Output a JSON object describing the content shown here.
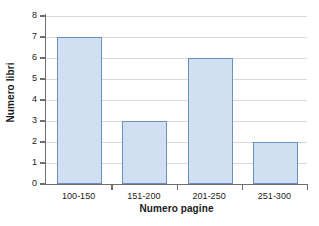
{
  "chart_data": {
    "type": "bar",
    "title": "",
    "categories": [
      "100-150",
      "151-200",
      "201-250",
      "251-300"
    ],
    "values": [
      7,
      3,
      6,
      2
    ],
    "xlabel": "Numero pagine",
    "ylabel": "Numero libri",
    "ylim": [
      0,
      8
    ],
    "yticks": [
      0,
      1,
      2,
      3,
      4,
      5,
      6,
      7,
      8
    ],
    "ytick_labels": [
      "0",
      "1",
      "2",
      "3",
      "4",
      "5",
      "6",
      "7",
      "8"
    ],
    "grid": "horizontal",
    "legend": "none",
    "colors": {
      "bar_fill": "#cfe0f2",
      "bar_border": "#6b8fc0",
      "gridline": "#d9d9d9",
      "axis": "#6e6e6e",
      "text": "#1a1a1a",
      "background": "#ffffff"
    }
  }
}
